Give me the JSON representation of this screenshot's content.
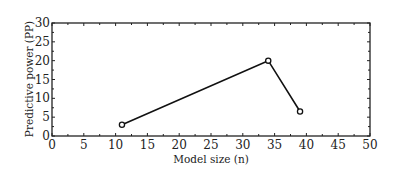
{
  "chart_data": {
    "type": "line",
    "title": "",
    "xlabel": "Model size (n)",
    "ylabel": "Predictive power (PP)",
    "xlim": [
      0,
      50
    ],
    "ylim": [
      0,
      30
    ],
    "xticks": [
      0,
      5,
      10,
      15,
      20,
      25,
      30,
      35,
      40,
      45,
      50
    ],
    "yticks": [
      0,
      5,
      10,
      15,
      20,
      25,
      30
    ],
    "grid": false,
    "legend": null,
    "series": [
      {
        "name": "PP",
        "marker": "open-circle",
        "color": "#111111",
        "x": [
          11,
          34,
          39
        ],
        "y": [
          3,
          20,
          6.5
        ]
      }
    ]
  },
  "colors": {
    "line": "#111111",
    "axis": "#222222",
    "background": "#ffffff"
  }
}
